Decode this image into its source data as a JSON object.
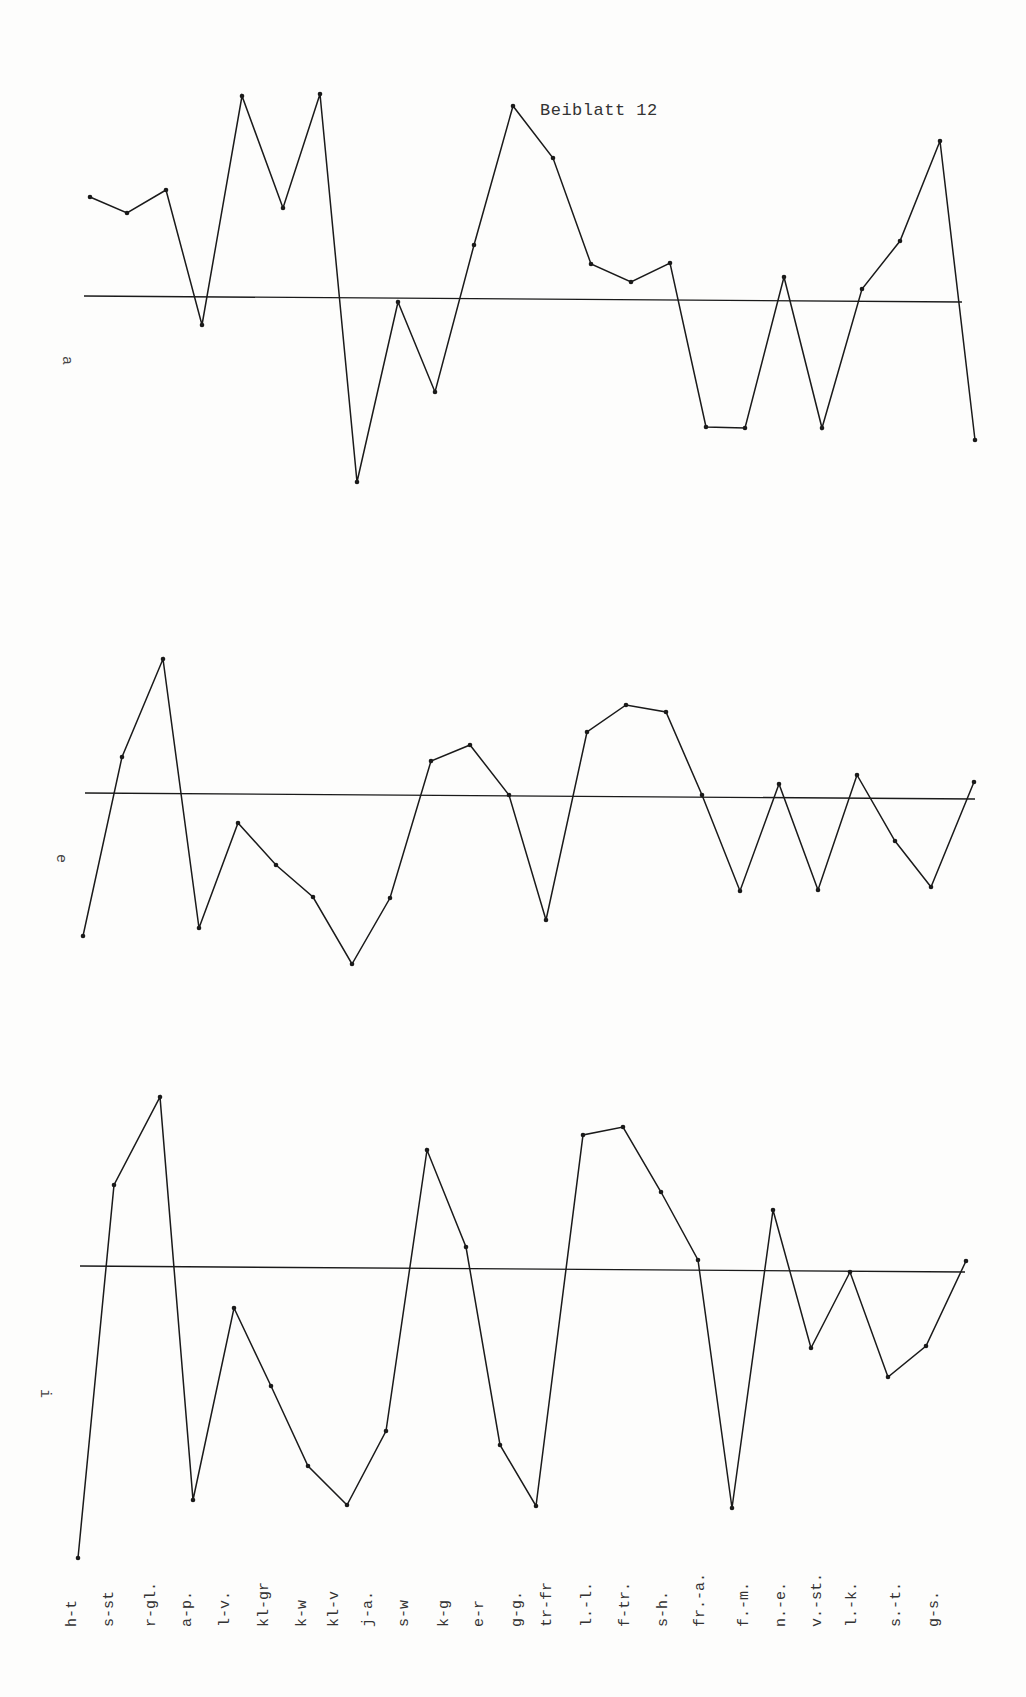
{
  "page": {
    "title": "Beiblatt 12"
  },
  "chart_data": [
    {
      "type": "line",
      "panel": "a",
      "title": "a",
      "xlabel": "",
      "ylabel": "a",
      "grid": false,
      "baseline": 0,
      "categories": [
        "h-t",
        "s-st",
        "r-gl.",
        "a-p.",
        "l-v.",
        "kl-gr",
        "k-w",
        "kl-v",
        "j-a.",
        "s-w",
        "k-g",
        "e-r",
        "g-g.",
        "tr-fr",
        "l.-l.",
        "f-tr.",
        "s-h.",
        "fr.-a.",
        "f.-m.",
        "n.-e.",
        "v.-st.",
        "l.-k.",
        "s.-t.",
        "g-s."
      ],
      "values": [
        10.1,
        8.5,
        10.8,
        -2.7,
        20.2,
        9.0,
        20.4,
        -18.4,
        -0.4,
        -9.4,
        5.3,
        19.2,
        14.0,
        3.4,
        1.6,
        3.5,
        -12.9,
        -13.0,
        2.1,
        -13.0,
        0.9,
        5.7,
        15.7,
        -14.2
      ],
      "ylim": [
        -20,
        22
      ]
    },
    {
      "type": "line",
      "panel": "e",
      "title": "e",
      "xlabel": "",
      "ylabel": "e",
      "grid": false,
      "baseline": 0,
      "categories": [
        "h-t",
        "s-st",
        "r-gl.",
        "a-p.",
        "l-v.",
        "kl-gr",
        "k-w",
        "kl-v",
        "j-a.",
        "s-w",
        "k-g",
        "e-r",
        "g-g.",
        "tr-fr",
        "l.-l.",
        "f-tr.",
        "s-h.",
        "fr.-a.",
        "f.-m.",
        "n.-e.",
        "v.-st.",
        "l.-k.",
        "s.-t.",
        "g-s."
      ],
      "values": [
        -14.1,
        3.8,
        13.6,
        -13.3,
        -2.8,
        -7.0,
        -10.2,
        -16.9,
        -10.3,
        3.4,
        5.0,
        0.0,
        -12.5,
        6.3,
        9.0,
        8.3,
        0.0,
        -9.6,
        1.1,
        -9.5,
        2.0,
        -4.6,
        -9.2,
        1.3
      ],
      "ylim": [
        -18,
        15
      ]
    },
    {
      "type": "line",
      "panel": "i",
      "title": "i",
      "xlabel": "",
      "ylabel": "i",
      "grid": false,
      "baseline": 0,
      "categories": [
        "h-t",
        "s-st",
        "r-gl.",
        "a-p.",
        "l-v.",
        "kl-gr",
        "k-w",
        "kl-v",
        "j-a.",
        "s-w",
        "k-g",
        "e-r",
        "g-g.",
        "tr-fr",
        "l.-l.",
        "f-tr.",
        "s-h.",
        "fr.-a.",
        "f.-m.",
        "n.-e.",
        "v.-st.",
        "l.-k.",
        "s.-t.",
        "g-s."
      ],
      "values": [
        -29.0,
        8.3,
        17.1,
        -23.2,
        -4.0,
        -11.8,
        -19.8,
        -23.7,
        -16.3,
        11.8,
        2.1,
        -17.7,
        -23.8,
        13.3,
        14.1,
        7.6,
        0.8,
        -24.0,
        5.8,
        -8.0,
        -0.4,
        -10.9,
        -7.8,
        0.7
      ],
      "ylim": [
        -30,
        19
      ]
    }
  ],
  "panels": {
    "a": {
      "label": "a"
    },
    "e": {
      "label": "e"
    },
    "i": {
      "label": "i"
    }
  },
  "x_axis": {
    "labels": [
      "h-t",
      "s-st",
      "r-gl.",
      "a-p.",
      "l-v.",
      "kl-gr",
      "k-w",
      "kl-v",
      "j-a.",
      "s-w",
      "k-g",
      "e-r",
      "g-g.",
      "tr-fr",
      "l.-l.",
      "f-tr.",
      "s-h.",
      "fr.-a.",
      "f.-m.",
      "n.-e.",
      "v.-st.",
      "l.-k.",
      "s.-t.",
      "g-s."
    ]
  },
  "style": {
    "line_color": "#1a1a1a",
    "paper_color": "#fdfdfc"
  }
}
